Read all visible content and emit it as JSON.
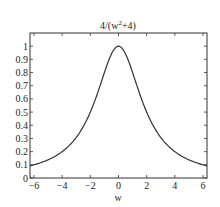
{
  "chart_data": {
    "type": "line",
    "title_parts": {
      "prefix": "4/(w",
      "sup": "2",
      "suffix": "+4)"
    },
    "xlabel": "w",
    "ylabel": "",
    "xlim": [
      -6.2832,
      6.2832
    ],
    "ylim": [
      0,
      1.1
    ],
    "xticks": [
      -6,
      -4,
      -2,
      0,
      2,
      4,
      6
    ],
    "xtick_labels": [
      "−6",
      "−4",
      "−2",
      "0",
      "2",
      "4",
      "6"
    ],
    "yticks": [
      0,
      0.1,
      0.2,
      0.3,
      0.4,
      0.5,
      0.6,
      0.7,
      0.8,
      0.9,
      1
    ],
    "ytick_labels": [
      "0",
      "0.1",
      "0.2",
      "0.3",
      "0.4",
      "0.5",
      "0.6",
      "0.7",
      "0.8",
      "0.9",
      "1"
    ],
    "grid": false,
    "legend": null,
    "series": [
      {
        "name": "4/(w^2+4)",
        "color": "#333333",
        "x": [
          -6.28,
          -5,
          -4,
          -3,
          -2,
          -1.5,
          -1,
          -0.5,
          0,
          0.5,
          1,
          1.5,
          2,
          3,
          4,
          5,
          6.28
        ],
        "y": [
          0.092,
          0.138,
          0.2,
          0.308,
          0.5,
          0.64,
          0.8,
          0.941,
          1.0,
          0.941,
          0.8,
          0.64,
          0.5,
          0.308,
          0.2,
          0.138,
          0.092
        ]
      }
    ]
  }
}
